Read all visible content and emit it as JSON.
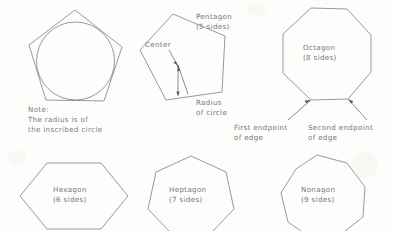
{
  "figure": {
    "background_color": "#fdfdfb",
    "ink_color": "#6e6e70",
    "text_color": "#76767a"
  },
  "shapes": {
    "inscribed_pentagon": {
      "name": "pentagon-with-inscribed-circle",
      "note_line_1": "Note:",
      "note_line_2": "The radius is of",
      "note_line_3": "the inscribed circle"
    },
    "annotated_pentagon": {
      "label_line_1": "Pentagon",
      "label_line_2": "(5 sides)",
      "center_label": "Center",
      "radius_label_line_1": "Radius",
      "radius_label_line_2": "of circle"
    },
    "octagon": {
      "label_line_1": "Octagon",
      "label_line_2": "(8 sides)",
      "first_endpoint_line_1": "First endpoint",
      "first_endpoint_line_2": "of edge",
      "second_endpoint_line_1": "Second endpoint",
      "second_endpoint_line_2": "of edge"
    },
    "hexagon": {
      "label_line_1": "Hexagon",
      "label_line_2": "(6 sides)"
    },
    "heptagon": {
      "label_line_1": "Heptagon",
      "label_line_2": "(7 sides)"
    },
    "nonagon": {
      "label_line_1": "Nonagon",
      "label_line_2": "(9 sides)"
    }
  }
}
